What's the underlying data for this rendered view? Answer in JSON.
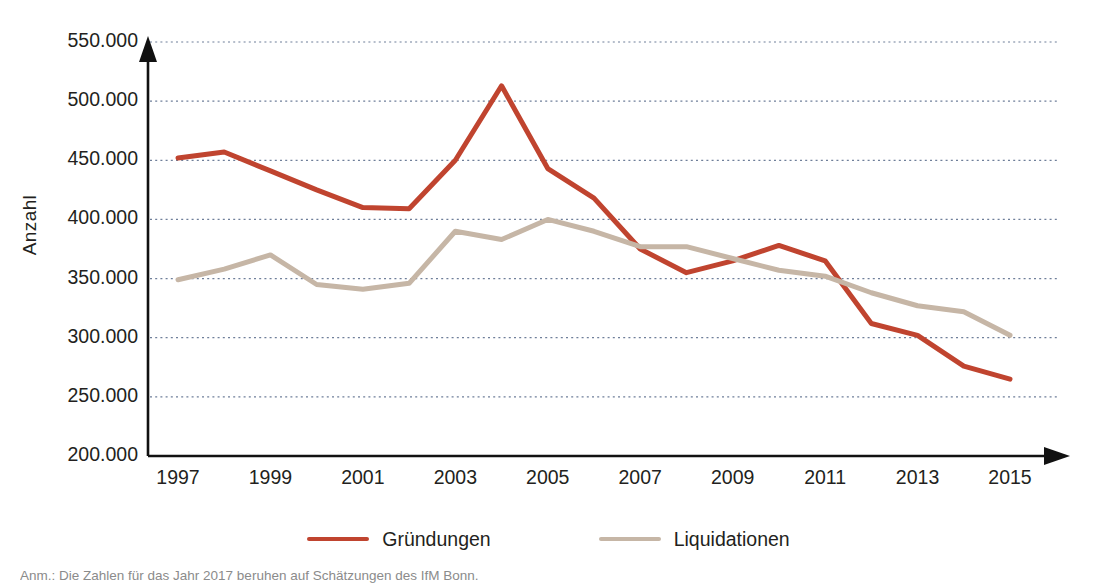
{
  "chart_data": {
    "type": "line",
    "title": "",
    "xlabel": "",
    "ylabel": "Anzahl",
    "grid": true,
    "legend_position": "bottom-center",
    "xlim": [
      1997,
      2015
    ],
    "ylim": [
      200000,
      550000
    ],
    "x": [
      1997,
      1998,
      1999,
      2000,
      2001,
      2002,
      2003,
      2004,
      2005,
      2006,
      2007,
      2008,
      2009,
      2010,
      2011,
      2012,
      2013,
      2014,
      2015
    ],
    "xtick_labels": [
      "1997",
      "1999",
      "2001",
      "2003",
      "2005",
      "2007",
      "2009",
      "2011",
      "2013",
      "2015"
    ],
    "xtick_values": [
      1997,
      1999,
      2001,
      2003,
      2005,
      2007,
      2009,
      2011,
      2013,
      2015
    ],
    "ytick_labels": [
      "550.000",
      "500.000",
      "450.000",
      "400.000",
      "350.000",
      "300.000",
      "250.000",
      "200.000"
    ],
    "ytick_values": [
      550000,
      500000,
      450000,
      400000,
      350000,
      300000,
      250000,
      200000
    ],
    "series": [
      {
        "name": "Gründungen",
        "color": "#C0442F",
        "values": [
          452000,
          457000,
          441000,
          425000,
          410000,
          409000,
          450000,
          513000,
          443000,
          418000,
          375000,
          355000,
          365000,
          378000,
          365000,
          312000,
          302000,
          276000,
          265000
        ]
      },
      {
        "name": "Liquidationen",
        "color": "#C6B6A6",
        "values": [
          349000,
          358000,
          370000,
          345000,
          341000,
          346000,
          390000,
          383000,
          400000,
          390000,
          377000,
          377000,
          367000,
          357000,
          352000,
          338000,
          327000,
          322000,
          302000
        ]
      }
    ]
  },
  "axis": {
    "y_title": "Anzahl",
    "axis_color": "#111111",
    "grid_color": "#6f7f9a"
  },
  "legend": {
    "items": [
      {
        "label": "Gründungen",
        "color": "#C0442F"
      },
      {
        "label": "Liquidationen",
        "color": "#C6B6A6"
      }
    ]
  },
  "caption": {
    "text": "Anm.: Die Zahlen für das Jahr 2017 beruhen auf Schätzungen des IfM Bonn."
  }
}
